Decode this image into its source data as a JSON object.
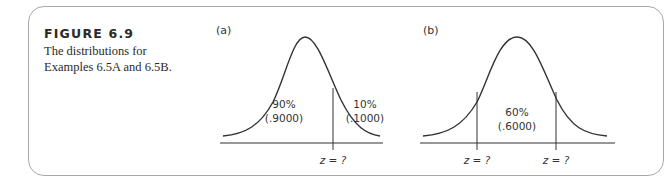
{
  "figure": {
    "title": "FIGURE 6.9",
    "description_line1": "The distributions for",
    "description_line2": "Examples 6.5A and 6.5B."
  },
  "panels": [
    {
      "label": "(a)",
      "regions": [
        {
          "pct": "90%",
          "prop": "(.9000)"
        },
        {
          "pct": "10%",
          "prop": "(.1000)"
        }
      ],
      "z_labels": [
        "z = ?"
      ]
    },
    {
      "label": "(b)",
      "regions": [
        {
          "pct": "60%",
          "prop": "(.6000)"
        }
      ],
      "z_labels": [
        "z = ?",
        "z = ?"
      ]
    }
  ],
  "colors": {
    "stroke": "#333333",
    "border": "#a8a8a8"
  }
}
